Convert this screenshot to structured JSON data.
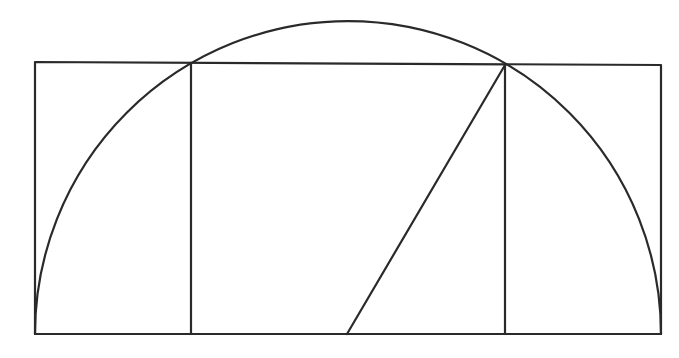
{
  "diagram": {
    "title": "",
    "stroke_color": "#2a2a2a",
    "background": "#ffffff",
    "stroke_width": 2.2,
    "outer_rectangle": {
      "x1": 35,
      "y_top_left": 62,
      "x2": 661,
      "y_top_right": 65,
      "y_bottom": 334
    },
    "inner_square": {
      "x1": 191,
      "x2": 505,
      "y_top_left": 63,
      "y_top_right": 65,
      "y_bottom": 334
    },
    "semicircle": {
      "cx": 348,
      "cy": 334,
      "r": 313
    },
    "diagonal": {
      "x1": 347,
      "y1": 334,
      "x2": 505,
      "y2": 65
    },
    "labels": []
  }
}
